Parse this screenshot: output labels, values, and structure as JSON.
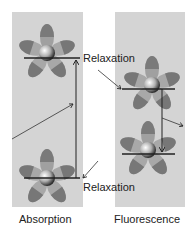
{
  "diagram": {
    "panels": [
      {
        "name": "absorption",
        "label": "Absorption"
      },
      {
        "name": "fluorescence",
        "label": "Fluorescence"
      }
    ],
    "annotations": {
      "relaxation_top": "Relaxation",
      "relaxation_bottom": "Relaxation"
    },
    "colors": {
      "panel_bg": "#d4d4d4",
      "petal_dark": "#7a7a7a",
      "petal_light": "#a8a8a8",
      "line": "#222222"
    }
  }
}
